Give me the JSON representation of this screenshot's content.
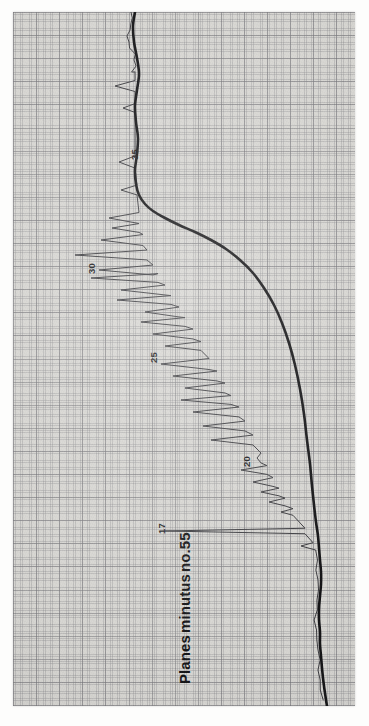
{
  "document": {
    "kind": "chart-recorder-trace",
    "medium": "graph-paper",
    "orientation": "rotated-90"
  },
  "caption": {
    "line1": "Planes",
    "line2": "minutus",
    "line3": "no.55"
  },
  "paper": {
    "background_color": "#d7d6d2",
    "major_grid_color": "#76767a",
    "minor_grid_color": "#828286",
    "major_grid_px": 23.1,
    "minor_grid_px": 2.31,
    "margin_color": "#fdfdfc"
  },
  "trace": {
    "baseline_color": "#121214",
    "baseline_width_px": 2.6,
    "peak_color": "#3a3a3e",
    "peak_width_px": 1.0
  },
  "annotations": [
    {
      "label": "35",
      "x": 117,
      "y": 148
    },
    {
      "label": "30",
      "x": 74,
      "y": 262
    },
    {
      "label": "25",
      "x": 136,
      "y": 351
    },
    {
      "label": "20",
      "x": 229,
      "y": 455
    },
    {
      "label": "17",
      "x": 144,
      "y": 522
    }
  ],
  "chart_data": {
    "type": "line",
    "title": "Planes minutus no.55",
    "xlabel": "",
    "ylabel": "",
    "orientation": "vertical-time-axis",
    "xlim": [
      0,
      342
    ],
    "ylim": [
      0,
      694
    ],
    "grid": true,
    "legend": "none",
    "series": [
      {
        "name": "baseline-envelope",
        "role": "thick-programmed-temperature-baseline",
        "points": [
          [
            122,
            0
          ],
          [
            120,
            14
          ],
          [
            121,
            30
          ],
          [
            124,
            46
          ],
          [
            126,
            62
          ],
          [
            124,
            78
          ],
          [
            122,
            94
          ],
          [
            123,
            110
          ],
          [
            125,
            126
          ],
          [
            124,
            142
          ],
          [
            122,
            158
          ],
          [
            123,
            172
          ],
          [
            126,
            183
          ],
          [
            132,
            192
          ],
          [
            140,
            199
          ],
          [
            152,
            206
          ],
          [
            166,
            213
          ],
          [
            182,
            220
          ],
          [
            198,
            228
          ],
          [
            213,
            237
          ],
          [
            227,
            248
          ],
          [
            240,
            261
          ],
          [
            251,
            276
          ],
          [
            261,
            293
          ],
          [
            269,
            311
          ],
          [
            276,
            331
          ],
          [
            282,
            353
          ],
          [
            287,
            377
          ],
          [
            291,
            402
          ],
          [
            294,
            428
          ],
          [
            297,
            452
          ],
          [
            299,
            474
          ],
          [
            301,
            493
          ],
          [
            303,
            510
          ],
          [
            305,
            524
          ],
          [
            306,
            536
          ],
          [
            307,
            548
          ],
          [
            308,
            560
          ],
          [
            308,
            572
          ],
          [
            307,
            584
          ],
          [
            306,
            596
          ],
          [
            306,
            608
          ],
          [
            307,
            620
          ],
          [
            307,
            632
          ],
          [
            308,
            644
          ],
          [
            309,
            656
          ],
          [
            310,
            666
          ],
          [
            311,
            674
          ],
          [
            312,
            681
          ],
          [
            313,
            688
          ],
          [
            314,
            694
          ]
        ]
      },
      {
        "name": "detector-signal",
        "role": "peaks",
        "peaks": [
          {
            "id": "t1",
            "apex_x": 102,
            "apex_y": 74,
            "base_x": 122,
            "width": 10
          },
          {
            "id": "t2",
            "apex_x": 110,
            "apex_y": 96,
            "base_x": 122,
            "width": 8
          },
          {
            "id": "35",
            "apex_x": 106,
            "apex_y": 150,
            "base_x": 122,
            "width": 11
          },
          {
            "id": "p4",
            "apex_x": 108,
            "apex_y": 178,
            "base_x": 124,
            "width": 9
          },
          {
            "id": "p5",
            "apex_x": 96,
            "apex_y": 206,
            "base_x": 126,
            "width": 10
          },
          {
            "id": "p6",
            "apex_x": 99,
            "apex_y": 216,
            "base_x": 126,
            "width": 8
          },
          {
            "id": "p7",
            "apex_x": 88,
            "apex_y": 228,
            "base_x": 130,
            "width": 10
          },
          {
            "id": "30",
            "apex_x": 62,
            "apex_y": 243,
            "base_x": 134,
            "width": 9
          },
          {
            "id": "p9",
            "apex_x": 86,
            "apex_y": 258,
            "base_x": 140,
            "width": 9
          },
          {
            "id": "p10",
            "apex_x": 78,
            "apex_y": 266,
            "base_x": 145,
            "width": 8
          },
          {
            "id": "p11",
            "apex_x": 108,
            "apex_y": 278,
            "base_x": 152,
            "width": 9
          },
          {
            "id": "p12",
            "apex_x": 104,
            "apex_y": 288,
            "base_x": 158,
            "width": 8
          },
          {
            "id": "p13",
            "apex_x": 132,
            "apex_y": 300,
            "base_x": 166,
            "width": 9
          },
          {
            "id": "p14",
            "apex_x": 128,
            "apex_y": 310,
            "base_x": 172,
            "width": 8
          },
          {
            "id": "p15",
            "apex_x": 140,
            "apex_y": 322,
            "base_x": 180,
            "width": 9
          },
          {
            "id": "p16",
            "apex_x": 152,
            "apex_y": 334,
            "base_x": 188,
            "width": 8
          },
          {
            "id": "25",
            "apex_x": 148,
            "apex_y": 352,
            "base_x": 196,
            "width": 10
          },
          {
            "id": "p18",
            "apex_x": 160,
            "apex_y": 364,
            "base_x": 204,
            "width": 9
          },
          {
            "id": "p19",
            "apex_x": 172,
            "apex_y": 376,
            "base_x": 212,
            "width": 9
          },
          {
            "id": "p20",
            "apex_x": 168,
            "apex_y": 388,
            "base_x": 218,
            "width": 8
          },
          {
            "id": "p21",
            "apex_x": 180,
            "apex_y": 400,
            "base_x": 226,
            "width": 9
          },
          {
            "id": "p22",
            "apex_x": 190,
            "apex_y": 414,
            "base_x": 232,
            "width": 9
          },
          {
            "id": "p23",
            "apex_x": 198,
            "apex_y": 428,
            "base_x": 240,
            "width": 9
          },
          {
            "id": "20",
            "apex_x": 244,
            "apex_y": 446,
            "base_x": 248,
            "width": 9
          },
          {
            "id": "p25",
            "apex_x": 228,
            "apex_y": 458,
            "base_x": 254,
            "width": 8
          },
          {
            "id": "p26",
            "apex_x": 240,
            "apex_y": 470,
            "base_x": 260,
            "width": 8
          },
          {
            "id": "p27",
            "apex_x": 248,
            "apex_y": 480,
            "base_x": 266,
            "width": 7
          },
          {
            "id": "p28",
            "apex_x": 256,
            "apex_y": 490,
            "base_x": 272,
            "width": 7
          },
          {
            "id": "p29",
            "apex_x": 268,
            "apex_y": 500,
            "base_x": 280,
            "width": 6
          },
          {
            "id": "17",
            "apex_x": 152,
            "apex_y": 519,
            "base_x": 292,
            "width": 5
          },
          {
            "id": "p31",
            "apex_x": 288,
            "apex_y": 534,
            "base_x": 300,
            "width": 6
          }
        ]
      }
    ]
  }
}
